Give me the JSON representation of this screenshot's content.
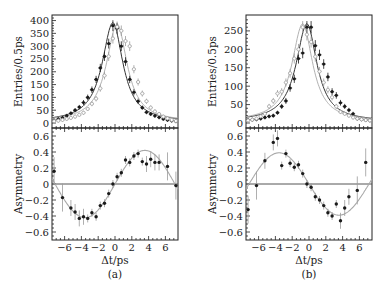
{
  "colors": {
    "frame": "#222222",
    "data_dark": "#1a1a1a",
    "data_light": "#9a9a9a",
    "fit_dark": "#333333",
    "fit_light": "#a8a8a8",
    "zero_line": "#555555"
  },
  "chart_data": [
    {
      "panel": "a",
      "caption": "(a)",
      "type": "line",
      "subplots": [
        {
          "name": "entries",
          "ylabel": "Entries/0.5ps",
          "ylim": [
            0,
            410
          ],
          "yticks": [
            0,
            50,
            100,
            150,
            200,
            250,
            300,
            350,
            400
          ],
          "xlim": [
            -7.5,
            7.5
          ],
          "series": [
            {
              "name": "filled (dark)",
              "marker": "filled",
              "x": [
                -7.25,
                -6.75,
                -6.25,
                -5.75,
                -5.25,
                -4.75,
                -4.25,
                -3.75,
                -3.25,
                -2.75,
                -2.25,
                -1.75,
                -1.25,
                -0.75,
                -0.25,
                0.25,
                0.75,
                1.25,
                1.75,
                2.25,
                2.75,
                3.25,
                3.75,
                4.25,
                4.75,
                5.25,
                5.75,
                6.25,
                6.75,
                7.25
              ],
              "y": [
                10,
                15,
                20,
                28,
                38,
                50,
                62,
                80,
                100,
                130,
                170,
                215,
                260,
                310,
                380,
                370,
                300,
                240,
                170,
                120,
                85,
                60,
                42,
                35,
                28,
                22,
                16,
                12,
                9,
                7
              ]
            },
            {
              "name": "open (light)",
              "marker": "open",
              "x": [
                -7.25,
                -6.75,
                -6.25,
                -5.75,
                -5.25,
                -4.75,
                -4.25,
                -3.75,
                -3.25,
                -2.75,
                -2.25,
                -1.75,
                -1.25,
                -0.75,
                -0.25,
                0.25,
                0.75,
                1.25,
                1.75,
                2.25,
                2.75,
                3.25,
                3.75,
                4.25,
                4.75,
                5.25,
                5.75,
                6.25,
                6.75,
                7.25
              ],
              "y": [
                7,
                9,
                12,
                16,
                20,
                25,
                32,
                40,
                55,
                75,
                95,
                135,
                185,
                260,
                330,
                375,
                360,
                320,
                300,
                210,
                160,
                115,
                85,
                60,
                45,
                35,
                25,
                18,
                12,
                8
              ]
            }
          ]
        },
        {
          "name": "asymmetry",
          "ylabel": "Asymmetry",
          "ylim": [
            -0.7,
            0.7
          ],
          "yticks": [
            -0.6,
            -0.4,
            -0.2,
            0,
            0.2,
            0.4,
            0.6
          ],
          "xlim": [
            -7.5,
            7.5
          ],
          "xticks": [
            -6,
            -4,
            -2,
            0,
            2,
            4,
            6
          ],
          "xlabel": "Δt/ps",
          "series": [
            {
              "name": "asymmetry data",
              "x": [
                -7.25,
                -6.25,
                -5.25,
                -4.75,
                -4.25,
                -3.75,
                -3.25,
                -2.75,
                -2.25,
                -1.75,
                -1.25,
                -0.75,
                -0.25,
                0.25,
                0.75,
                1.25,
                1.75,
                2.25,
                2.75,
                3.25,
                3.75,
                4.25,
                4.75,
                5.25,
                6.25,
                7.25
              ],
              "y": [
                0.16,
                -0.17,
                -0.3,
                -0.35,
                -0.43,
                -0.41,
                -0.43,
                -0.36,
                -0.41,
                -0.27,
                -0.24,
                -0.12,
                0.0,
                0.09,
                0.14,
                0.3,
                0.27,
                0.35,
                0.38,
                0.28,
                0.25,
                0.31,
                0.27,
                0.27,
                0.22,
                -0.02
              ]
            },
            {
              "name": "fit",
              "function": "0.42*sin(0.44*t)"
            }
          ]
        }
      ]
    },
    {
      "panel": "b",
      "caption": "(b)",
      "type": "line",
      "subplots": [
        {
          "name": "entries",
          "ylabel": "Entries/0.5ps",
          "ylim": [
            0,
            285
          ],
          "yticks": [
            0,
            50,
            100,
            150,
            200,
            250
          ],
          "xlim": [
            -7.5,
            7.5
          ],
          "series": [
            {
              "name": "filled (dark)",
              "marker": "filled",
              "x": [
                -7.25,
                -6.75,
                -6.25,
                -5.75,
                -5.25,
                -4.75,
                -4.25,
                -3.75,
                -3.25,
                -2.75,
                -2.25,
                -1.75,
                -1.25,
                -0.75,
                -0.25,
                0.25,
                0.75,
                1.25,
                1.75,
                2.25,
                2.75,
                3.25,
                3.75,
                4.25,
                4.75,
                5.25,
                5.75,
                6.25,
                6.75,
                7.25
              ],
              "y": [
                8,
                9,
                10,
                12,
                15,
                18,
                20,
                28,
                45,
                60,
                95,
                120,
                175,
                190,
                260,
                260,
                210,
                185,
                160,
                125,
                85,
                75,
                55,
                45,
                35,
                25,
                12,
                10,
                8,
                7
              ]
            },
            {
              "name": "open (light)",
              "marker": "open",
              "x": [
                -7.25,
                -6.75,
                -6.25,
                -5.75,
                -5.25,
                -4.75,
                -4.25,
                -3.75,
                -3.25,
                -2.75,
                -2.25,
                -1.75,
                -1.25,
                -0.75,
                -0.25,
                0.25,
                0.75,
                1.25,
                1.75,
                2.25,
                2.75,
                3.25,
                3.75,
                4.25,
                4.75,
                5.25,
                5.75,
                6.25,
                6.75,
                7.25
              ],
              "y": [
                7,
                9,
                12,
                18,
                25,
                45,
                60,
                80,
                85,
                110,
                135,
                175,
                200,
                260,
                240,
                220,
                180,
                140,
                110,
                90,
                70,
                45,
                30,
                25,
                20,
                15,
                12,
                10,
                8,
                7
              ]
            }
          ]
        },
        {
          "name": "asymmetry",
          "ylabel": "Asymmetry",
          "ylim": [
            -0.7,
            0.7
          ],
          "yticks": [
            -0.6,
            -0.4,
            -0.2,
            0,
            0.2,
            0.4,
            0.6
          ],
          "xlim": [
            -7.5,
            7.5
          ],
          "xticks": [
            -6,
            -4,
            -2,
            0,
            2,
            4,
            6
          ],
          "xlabel": "Δt/ps",
          "series": [
            {
              "name": "asymmetry data",
              "x": [
                -7.25,
                -6.25,
                -5.25,
                -4.25,
                -3.75,
                -3.25,
                -2.75,
                -2.25,
                -1.75,
                -1.25,
                -0.75,
                -0.25,
                0.25,
                0.75,
                1.25,
                1.75,
                2.25,
                2.75,
                3.25,
                3.75,
                4.25,
                4.75,
                5.75,
                6.75
              ],
              "y": [
                -0.32,
                -0.02,
                0.29,
                0.52,
                0.57,
                0.23,
                0.38,
                0.26,
                0.21,
                0.24,
                0.13,
                0.0,
                -0.04,
                -0.16,
                -0.2,
                -0.27,
                -0.36,
                -0.4,
                -0.25,
                -0.46,
                -0.3,
                -0.16,
                -0.08,
                0.27
              ]
            },
            {
              "name": "fit",
              "function": "-0.39*sin(0.44*t)"
            }
          ]
        }
      ]
    }
  ]
}
